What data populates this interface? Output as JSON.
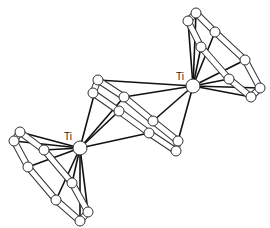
{
  "diagram": {
    "type": "molecular-structure",
    "style": "ball-and-stick",
    "colors": {
      "bond": "#111111",
      "atom_fill": "#ffffff",
      "atom_stroke": "#333333",
      "ring_bond_fill": "#ffffff"
    },
    "labels": [
      {
        "id": "ti1",
        "text": "Ti",
        "x": 176,
        "y": 80
      },
      {
        "id": "ti2",
        "text": "Ti",
        "x": 64,
        "y": 140
      }
    ],
    "metals": [
      {
        "id": "ti1",
        "x": 193,
        "y": 86,
        "r": 7
      },
      {
        "id": "ti2",
        "x": 80,
        "y": 148,
        "r": 7
      }
    ],
    "rings": [
      {
        "id": "upper-ring",
        "atoms": [
          [
            196,
            13
          ],
          [
            188,
            21
          ],
          [
            215,
            32
          ],
          [
            201,
            47
          ],
          [
            245,
            60
          ],
          [
            229,
            79
          ],
          [
            260,
            88
          ],
          [
            251,
            97
          ]
        ],
        "order": [
          0,
          2,
          4,
          6,
          7,
          5,
          3,
          1
        ],
        "metal": "ti1"
      },
      {
        "id": "lower-ring",
        "atoms": [
          [
            20,
            132
          ],
          [
            14,
            141
          ],
          [
            44,
            150
          ],
          [
            28,
            167
          ],
          [
            72,
            183
          ],
          [
            56,
            200
          ],
          [
            88,
            212
          ],
          [
            80,
            221
          ]
        ],
        "order": [
          0,
          2,
          4,
          6,
          7,
          5,
          3,
          1
        ],
        "metal": "ti2"
      },
      {
        "id": "bridge-ring",
        "atoms": [
          [
            98,
            80
          ],
          [
            93,
            93
          ],
          [
            124,
            97
          ],
          [
            119,
            111
          ],
          [
            153,
            121
          ],
          [
            149,
            133
          ],
          [
            178,
            141
          ],
          [
            176,
            151
          ]
        ],
        "order": [
          0,
          2,
          4,
          6,
          7,
          5,
          3,
          1
        ],
        "metal": "both"
      }
    ],
    "metal_bonds": [
      [
        "ti1",
        [
          124,
          97
        ]
      ],
      [
        "ti1",
        [
          153,
          121
        ]
      ],
      [
        "ti1",
        [
          178,
          141
        ]
      ],
      [
        "ti1",
        [
          98,
          80
        ]
      ],
      [
        "ti2",
        [
          98,
          80
        ]
      ],
      [
        "ti2",
        [
          119,
          111
        ]
      ],
      [
        "ti2",
        [
          149,
          133
        ]
      ],
      [
        "ti2",
        [
          124,
          97
        ]
      ]
    ]
  }
}
